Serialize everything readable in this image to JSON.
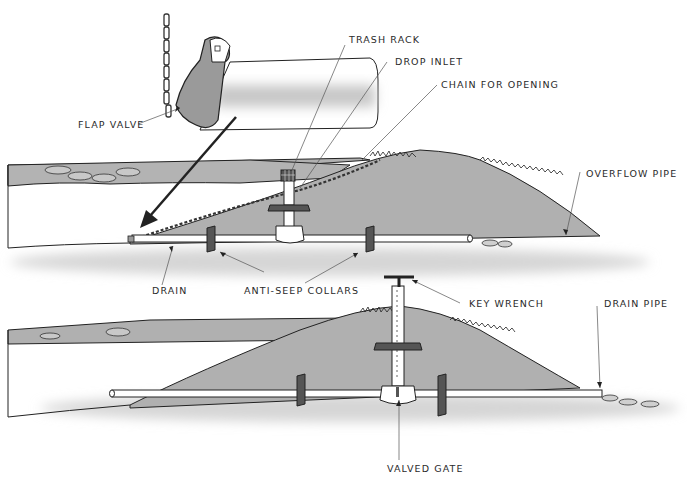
{
  "diagram": {
    "colors": {
      "earth": "#b5b5b5",
      "earth_dark": "#9a9a9a",
      "line": "#222222",
      "pipe": "#ffffff",
      "collar": "#555555",
      "shadow": "#cfcfcf"
    },
    "top_system": {
      "labels": {
        "flap_valve": "FLAP VALVE",
        "trash_rack": "TRASH RACK",
        "drop_inlet": "DROP INLET",
        "chain": "CHAIN FOR OPENING",
        "overflow_pipe": "OVERFLOW PIPE",
        "drain": "DRAIN",
        "anti_seep": "ANTI-SEEP COLLARS"
      }
    },
    "bottom_system": {
      "labels": {
        "key_wrench": "KEY WRENCH",
        "drain_pipe": "DRAIN PIPE",
        "valved_gate": "VALVED GATE"
      }
    }
  }
}
